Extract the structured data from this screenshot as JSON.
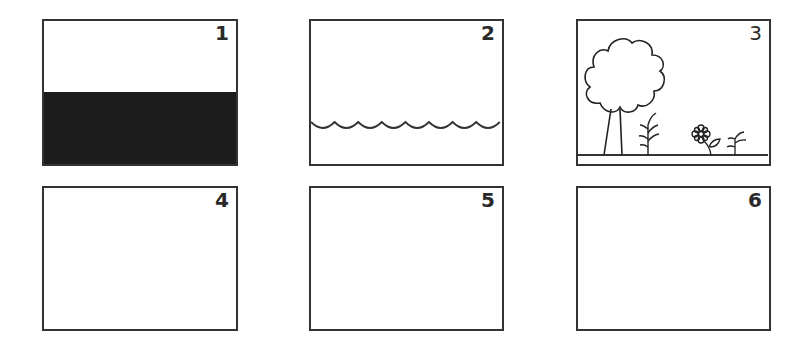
{
  "panels": [
    {
      "label": "1",
      "content": "dark-lower-half",
      "fill_color": "#1c1c1c"
    },
    {
      "label": "2",
      "content": "water-waves",
      "wave_count": 8
    },
    {
      "label": "3",
      "content": "landscape-tree-plants-flower"
    },
    {
      "label": "4",
      "content": "empty"
    },
    {
      "label": "5",
      "content": "empty"
    },
    {
      "label": "6",
      "content": "empty"
    }
  ],
  "colors": {
    "stroke": "#333333",
    "background": "#ffffff"
  }
}
